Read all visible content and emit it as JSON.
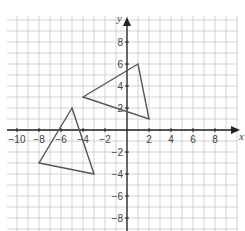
{
  "chart_data": {
    "type": "scatter",
    "title": "",
    "xlabel": "x",
    "ylabel": "y",
    "xlim": [
      -11,
      10
    ],
    "ylim": [
      -9,
      10
    ],
    "grid": true,
    "grid_step": 1,
    "x_ticks": [
      -10,
      -8,
      -6,
      -4,
      -2,
      2,
      4,
      6,
      8
    ],
    "x_tick_labels": [
      "−10",
      "−8",
      "−6",
      "−4",
      "−2",
      "2",
      "4",
      "6",
      "8"
    ],
    "y_ticks": [
      8,
      6,
      4,
      2,
      -2,
      -4,
      -6,
      -8
    ],
    "y_tick_labels": [
      "8",
      "6",
      "4",
      "2",
      "−2",
      "−4",
      "−6",
      "−8"
    ],
    "series": [
      {
        "name": "triangle-1",
        "shape": "polygon",
        "points": [
          [
            -4,
            3
          ],
          [
            1,
            6
          ],
          [
            2,
            1
          ]
        ]
      },
      {
        "name": "triangle-2",
        "shape": "polygon",
        "points": [
          [
            -5,
            2
          ],
          [
            -8,
            -3
          ],
          [
            -3,
            -4
          ]
        ]
      }
    ],
    "colors": {
      "grid": "#c8c8c8",
      "axis": "#222222",
      "shape": "#555555"
    }
  }
}
